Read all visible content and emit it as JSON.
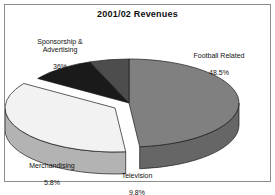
{
  "frame": {
    "border_color": "#8c8c8c"
  },
  "chart_data": {
    "type": "pie",
    "title": "2001/02 Revenues",
    "xlabel": "",
    "ylabel": "",
    "legend_position": "none",
    "grid": false,
    "three_d": true,
    "exploded_slice": "Sponsorship & Advertising",
    "categories": [
      "Football Related",
      "Sponsorship & Advertising",
      "Television",
      "Merchandising"
    ],
    "values": [
      48.5,
      36,
      9.8,
      5.8
    ],
    "value_unit": "%",
    "colors": [
      "#808080",
      "#f2f2f2",
      "#1a1a1a",
      "#4d4d4d"
    ],
    "slices": [
      {
        "name": "Football Related",
        "value": 48.5,
        "value_label": "48.5%",
        "color": "#808080",
        "side_color": "#666666"
      },
      {
        "name": "Sponsorship & Advertising",
        "value": 36,
        "value_label": "36%",
        "color": "#f2f2f2",
        "side_color": "#b3b3b3"
      },
      {
        "name": "Television",
        "value": 9.8,
        "value_label": "9.8%",
        "color": "#1a1a1a",
        "side_color": "#111111"
      },
      {
        "name": "Merchandising",
        "value": 5.8,
        "value_label": "5.8%",
        "color": "#4d4d4d",
        "side_color": "#3a3a3a"
      }
    ]
  },
  "labels": {
    "sponsorship": {
      "name": "Sponsorship &\nAdvertising",
      "value": "36%"
    },
    "football": {
      "name": "Football Related",
      "value": "48.5%"
    },
    "merchandising": {
      "name": "Merchandising",
      "value": "5.8%"
    },
    "television": {
      "name": "Television",
      "value": "9.8%"
    }
  }
}
